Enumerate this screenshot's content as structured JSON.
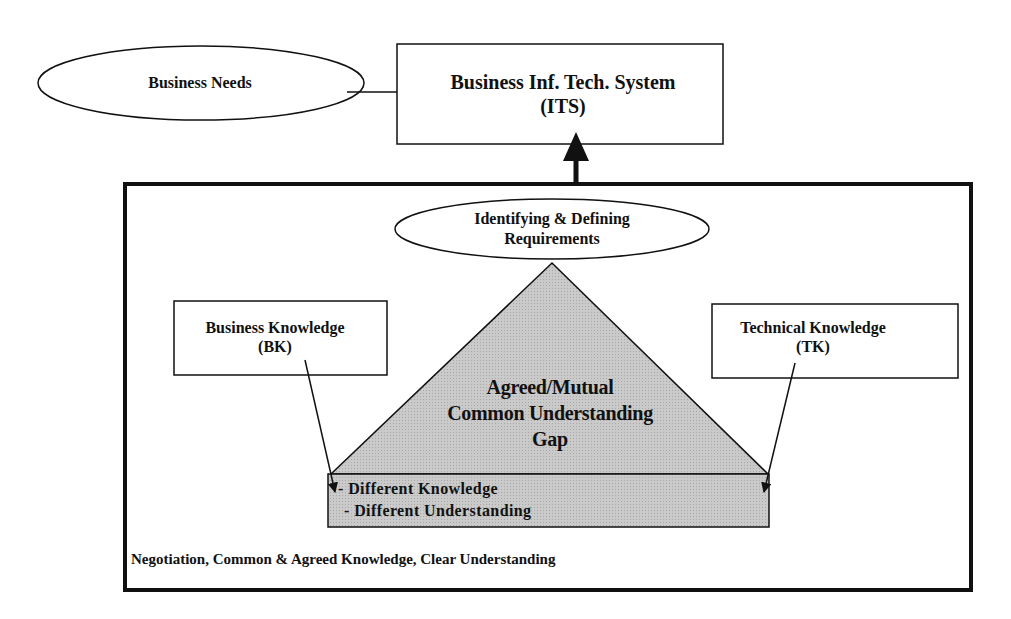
{
  "diagram": {
    "business_needs": "Business Needs",
    "its": {
      "line1": "Business Inf. Tech. System",
      "line2": "(ITS)"
    },
    "requirements": {
      "line1": "Identifying & Defining",
      "line2": "Requirements"
    },
    "business_knowledge": {
      "line1": "Business Knowledge",
      "line2": "(BK)"
    },
    "technical_knowledge": {
      "line1": "Technical Knowledge",
      "line2": "(TK)"
    },
    "triangle": {
      "line1": "Agreed/Mutual",
      "line2": "Common Understanding",
      "line3": "Gap"
    },
    "gap_items": [
      "- Different Knowledge",
      "- Different Understanding"
    ],
    "footer": "Negotiation, Common & Agreed Knowledge, Clear Understanding",
    "colors": {
      "shape_fill": "#c8c8c8",
      "stroke": "#111111",
      "background": "#ffffff"
    }
  }
}
